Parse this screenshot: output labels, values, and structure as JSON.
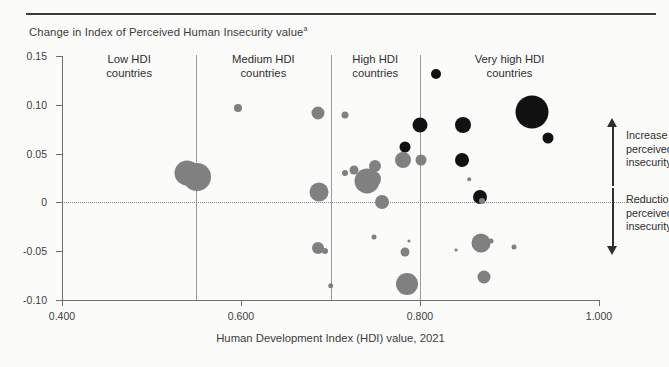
{
  "figure": {
    "y_axis_caption": "Change in Index of Perceived Human Insecurity value",
    "y_axis_caption_superscript": "a",
    "x_axis_title": "Human Development Index (HDI) value, 2021"
  },
  "annotations": {
    "increase": "Increase in\nperceived\ninsecurity",
    "increase_lines": [
      "Increase in",
      "perceived",
      "insecurity"
    ],
    "reduction": "Reduction in\nperceived\ninsecurity",
    "reduction_lines": [
      "Reduction in",
      "perceived",
      "insecurity"
    ],
    "arrow_up": "up-arrow",
    "arrow_down": "down-arrow"
  },
  "colors": {
    "bubble_dark": "#111111",
    "bubble_gray": "#808080",
    "axis": "#6e6e6e",
    "divider": "#9a9a9a",
    "text": "#3c3c3c",
    "rule": "#3b3b3b",
    "background": "#fbfbfa"
  },
  "chart_data": {
    "type": "scatter",
    "title": "",
    "subtitle": "",
    "xlabel": "Human Development Index (HDI) value, 2021",
    "ylabel": "Change in Index of Perceived Human Insecurity value",
    "xlim": [
      0.4,
      1.0
    ],
    "ylim": [
      -0.1,
      0.15
    ],
    "xticks": [
      0.4,
      0.6,
      0.8,
      1.0
    ],
    "xtick_labels": [
      "0.400",
      "0.600",
      "0.800",
      "1.000"
    ],
    "yticks": [
      0.15,
      0.1,
      0.05,
      0,
      -0.05,
      -0.1
    ],
    "ytick_labels": [
      "0.15",
      "0.10",
      "0.05",
      "0",
      "-0.05",
      "-0.10"
    ],
    "grid": false,
    "legend": null,
    "zero_reference_line": 0,
    "group_dividers": [
      0.55,
      0.7,
      0.8
    ],
    "groups": [
      {
        "id": "low",
        "label_lines": [
          "Low HDI",
          "countries"
        ],
        "label": "Low HDI countries",
        "center_x": 0.475
      },
      {
        "id": "medium",
        "label_lines": [
          "Medium HDI",
          "countries"
        ],
        "label": "Medium HDI countries",
        "center_x": 0.625
      },
      {
        "id": "high",
        "label_lines": [
          "High HDI",
          "countries"
        ],
        "label": "High HDI countries",
        "center_x": 0.75
      },
      {
        "id": "very_high",
        "label_lines": [
          "Very high HDI",
          "countries"
        ],
        "label": "Very high HDI countries",
        "center_x": 0.9
      }
    ],
    "size_encoding": "bubble area ~ population",
    "points": [
      {
        "x": 0.54,
        "y": 0.0305,
        "r": 12.5,
        "color": "#808080"
      },
      {
        "x": 0.551,
        "y": 0.0265,
        "r": 14.0,
        "color": "#808080"
      },
      {
        "x": 0.597,
        "y": 0.097,
        "r": 4.0,
        "color": "#808080"
      },
      {
        "x": 0.686,
        "y": 0.0915,
        "r": 6.5,
        "color": "#808080"
      },
      {
        "x": 0.687,
        "y": 0.0105,
        "r": 9.5,
        "color": "#808080"
      },
      {
        "x": 0.686,
        "y": -0.0465,
        "r": 6.0,
        "color": "#808080"
      },
      {
        "x": 0.694,
        "y": -0.0495,
        "r": 3.0,
        "color": "#808080"
      },
      {
        "x": 0.7,
        "y": -0.0855,
        "r": 2.8,
        "color": "#808080"
      },
      {
        "x": 0.716,
        "y": 0.09,
        "r": 3.5,
        "color": "#808080"
      },
      {
        "x": 0.716,
        "y": 0.0305,
        "r": 3.0,
        "color": "#808080"
      },
      {
        "x": 0.726,
        "y": 0.033,
        "r": 4.5,
        "color": "#808080"
      },
      {
        "x": 0.75,
        "y": 0.037,
        "r": 6.0,
        "color": "#808080"
      },
      {
        "x": 0.741,
        "y": 0.0215,
        "r": 12.5,
        "color": "#808080"
      },
      {
        "x": 0.747,
        "y": 0.024,
        "r": 8.0,
        "color": "#808080"
      },
      {
        "x": 0.757,
        "y": 0.0,
        "r": 7.0,
        "color": "#808080"
      },
      {
        "x": 0.749,
        "y": -0.0355,
        "r": 2.5,
        "color": "#808080"
      },
      {
        "x": 0.788,
        "y": -0.0395,
        "r": 1.6,
        "color": "#808080"
      },
      {
        "x": 0.783,
        "y": 0.057,
        "r": 5.5,
        "color": "#111111"
      },
      {
        "x": 0.781,
        "y": 0.0435,
        "r": 8.0,
        "color": "#808080"
      },
      {
        "x": 0.801,
        "y": 0.0435,
        "r": 5.5,
        "color": "#808080"
      },
      {
        "x": 0.783,
        "y": -0.051,
        "r": 4.5,
        "color": "#808080"
      },
      {
        "x": 0.786,
        "y": -0.0835,
        "r": 11.0,
        "color": "#808080"
      },
      {
        "x": 0.818,
        "y": 0.1315,
        "r": 5.0,
        "color": "#111111"
      },
      {
        "x": 0.8,
        "y": 0.079,
        "r": 7.5,
        "color": "#111111"
      },
      {
        "x": 0.848,
        "y": 0.079,
        "r": 8.0,
        "color": "#111111"
      },
      {
        "x": 0.847,
        "y": 0.043,
        "r": 7.0,
        "color": "#111111"
      },
      {
        "x": 0.855,
        "y": 0.0235,
        "r": 1.8,
        "color": "#808080"
      },
      {
        "x": 0.867,
        "y": 0.006,
        "r": 7.0,
        "color": "#111111"
      },
      {
        "x": 0.869,
        "y": 0.001,
        "r": 3.0,
        "color": "#808080"
      },
      {
        "x": 0.925,
        "y": 0.093,
        "r": 16.5,
        "color": "#111111"
      },
      {
        "x": 0.943,
        "y": 0.0655,
        "r": 5.5,
        "color": "#111111"
      },
      {
        "x": 0.868,
        "y": -0.0415,
        "r": 9.5,
        "color": "#808080"
      },
      {
        "x": 0.879,
        "y": -0.04,
        "r": 2.5,
        "color": "#808080"
      },
      {
        "x": 0.905,
        "y": -0.0455,
        "r": 2.5,
        "color": "#808080"
      },
      {
        "x": 0.872,
        "y": -0.076,
        "r": 6.5,
        "color": "#808080"
      },
      {
        "x": 0.84,
        "y": -0.0485,
        "r": 1.4,
        "color": "#808080"
      }
    ]
  }
}
